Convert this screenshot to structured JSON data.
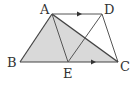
{
  "diagram": {
    "type": "geometry",
    "points": {
      "A": {
        "label": "A",
        "x": 52,
        "y": 14
      },
      "D": {
        "label": "D",
        "x": 102,
        "y": 14
      },
      "B": {
        "label": "B",
        "x": 20,
        "y": 62
      },
      "E": {
        "label": "E",
        "x": 68,
        "y": 62
      },
      "C": {
        "label": "C",
        "x": 118,
        "y": 62
      }
    },
    "segments": [
      "AB",
      "AD",
      "DC",
      "BC",
      "AC",
      "AE",
      "DE"
    ],
    "parallel": [
      "AD",
      "BC"
    ],
    "shaded": "ABC",
    "colors": {
      "stroke": "#444444",
      "fill": "#d9d9d9"
    }
  }
}
